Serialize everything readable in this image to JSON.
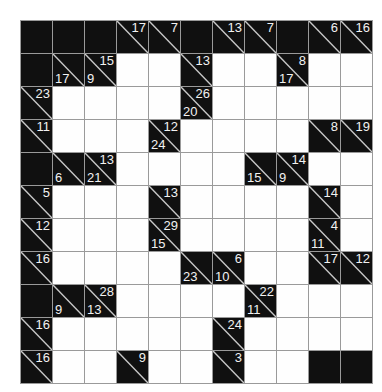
{
  "puzzle": {
    "type": "kakuro",
    "rows": 11,
    "cols": 11,
    "colors": {
      "block": "#101010",
      "empty": "#fefefe",
      "grid_line": "#9a9a9a",
      "clue_text": "#f2f2f2",
      "page_background": "#ffffff"
    },
    "legend": {
      "block": "filled block cell, no clue",
      "white": "empty entry cell for a digit",
      "clue": "block cell split by a diagonal; number above-right is the DOWN sum, number below-left is the ACROSS sum"
    },
    "cells": [
      [
        {
          "t": "block"
        },
        {
          "t": "block"
        },
        {
          "t": "block"
        },
        {
          "t": "clue",
          "down": "17"
        },
        {
          "t": "clue",
          "down": "7"
        },
        {
          "t": "block"
        },
        {
          "t": "clue",
          "down": "13"
        },
        {
          "t": "clue",
          "down": "7"
        },
        {
          "t": "block"
        },
        {
          "t": "clue",
          "down": "6"
        },
        {
          "t": "clue",
          "down": "16"
        }
      ],
      [
        {
          "t": "block"
        },
        {
          "t": "clue",
          "across": "17"
        },
        {
          "t": "clue",
          "down": "15",
          "across": "9"
        },
        {
          "t": "white"
        },
        {
          "t": "white"
        },
        {
          "t": "clue",
          "down": "13"
        },
        {
          "t": "white"
        },
        {
          "t": "white"
        },
        {
          "t": "clue",
          "down": "8",
          "across": "17"
        },
        {
          "t": "white"
        },
        {
          "t": "white"
        }
      ],
      [
        {
          "t": "clue",
          "down": "23"
        },
        {
          "t": "white"
        },
        {
          "t": "white"
        },
        {
          "t": "white"
        },
        {
          "t": "white"
        },
        {
          "t": "clue",
          "down": "26",
          "across": "20"
        },
        {
          "t": "white"
        },
        {
          "t": "white"
        },
        {
          "t": "white"
        },
        {
          "t": "white"
        },
        {
          "t": "white"
        }
      ],
      [
        {
          "t": "clue",
          "down": "11"
        },
        {
          "t": "white"
        },
        {
          "t": "white"
        },
        {
          "t": "white"
        },
        {
          "t": "clue",
          "down": "12",
          "across": "24"
        },
        {
          "t": "white"
        },
        {
          "t": "white"
        },
        {
          "t": "white"
        },
        {
          "t": "white"
        },
        {
          "t": "clue",
          "down": "8"
        },
        {
          "t": "clue",
          "down": "19"
        }
      ],
      [
        {
          "t": "block"
        },
        {
          "t": "clue",
          "across": "6"
        },
        {
          "t": "clue",
          "down": "13",
          "across": "21"
        },
        {
          "t": "white"
        },
        {
          "t": "white"
        },
        {
          "t": "white"
        },
        {
          "t": "white"
        },
        {
          "t": "clue",
          "across": "15"
        },
        {
          "t": "clue",
          "down": "14",
          "across": "9"
        },
        {
          "t": "white"
        },
        {
          "t": "white"
        }
      ],
      [
        {
          "t": "clue",
          "down": "5"
        },
        {
          "t": "white"
        },
        {
          "t": "white"
        },
        {
          "t": "white"
        },
        {
          "t": "clue",
          "down": "13"
        },
        {
          "t": "white"
        },
        {
          "t": "white"
        },
        {
          "t": "white"
        },
        {
          "t": "white"
        },
        {
          "t": "clue",
          "down": "14"
        },
        {
          "t": "white"
        }
      ],
      [
        {
          "t": "clue",
          "down": "12"
        },
        {
          "t": "white"
        },
        {
          "t": "white"
        },
        {
          "t": "white"
        },
        {
          "t": "clue",
          "down": "29",
          "across": "15"
        },
        {
          "t": "white"
        },
        {
          "t": "white"
        },
        {
          "t": "white"
        },
        {
          "t": "white"
        },
        {
          "t": "clue",
          "down": "4",
          "across": "11"
        },
        {
          "t": "white"
        }
      ],
      [
        {
          "t": "clue",
          "down": "16"
        },
        {
          "t": "white"
        },
        {
          "t": "white"
        },
        {
          "t": "white"
        },
        {
          "t": "white"
        },
        {
          "t": "clue",
          "across": "23"
        },
        {
          "t": "clue",
          "down": "6",
          "across": "10"
        },
        {
          "t": "white"
        },
        {
          "t": "white"
        },
        {
          "t": "clue",
          "down": "17"
        },
        {
          "t": "clue",
          "down": "12"
        }
      ],
      [
        {
          "t": "block"
        },
        {
          "t": "clue",
          "across": "9"
        },
        {
          "t": "clue",
          "down": "28",
          "across": "13"
        },
        {
          "t": "white"
        },
        {
          "t": "white"
        },
        {
          "t": "white"
        },
        {
          "t": "white"
        },
        {
          "t": "clue",
          "down": "22",
          "across": "11"
        },
        {
          "t": "white"
        },
        {
          "t": "white"
        },
        {
          "t": "white"
        }
      ],
      [
        {
          "t": "clue",
          "down": "16"
        },
        {
          "t": "white"
        },
        {
          "t": "white"
        },
        {
          "t": "white"
        },
        {
          "t": "white"
        },
        {
          "t": "white"
        },
        {
          "t": "clue",
          "down": "24"
        },
        {
          "t": "white"
        },
        {
          "t": "white"
        },
        {
          "t": "white"
        },
        {
          "t": "white"
        }
      ],
      [
        {
          "t": "clue",
          "down": "16"
        },
        {
          "t": "white"
        },
        {
          "t": "white"
        },
        {
          "t": "clue",
          "down": "9"
        },
        {
          "t": "white"
        },
        {
          "t": "white"
        },
        {
          "t": "clue",
          "down": "3"
        },
        {
          "t": "white"
        },
        {
          "t": "white"
        },
        {
          "t": "block"
        },
        {
          "t": "block"
        }
      ]
    ]
  }
}
